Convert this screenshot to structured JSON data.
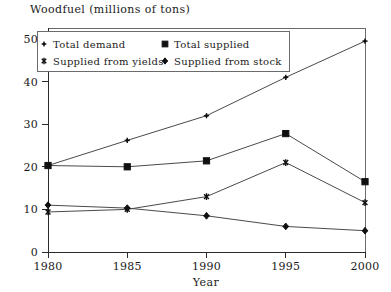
{
  "chart_data": {
    "type": "line",
    "title": "Woodfuel (millions of tons)",
    "xlabel": "Year",
    "ylabel": "",
    "x": [
      1980,
      1985,
      1990,
      1995,
      2000
    ],
    "categories": [
      "1980",
      "1985",
      "1990",
      "1995",
      "2000"
    ],
    "xlim": [
      1980,
      2000
    ],
    "ylim": [
      0,
      53
    ],
    "yticks": [
      0,
      10,
      20,
      30,
      40,
      50
    ],
    "ytick_labels": [
      "0",
      "10",
      "20",
      "30",
      "40",
      "50"
    ],
    "xticks": [
      1980,
      1985,
      1990,
      1995,
      2000
    ],
    "xtick_labels": [
      "1980",
      "1985",
      "1990",
      "1995",
      "2000"
    ],
    "grid": false,
    "legend_position": "top-left-inside",
    "series": [
      {
        "name": "Total demand",
        "marker": "plus",
        "values": [
          20.3,
          26.2,
          32.0,
          41.0,
          49.5
        ]
      },
      {
        "name": "Total supplied",
        "marker": "square",
        "values": [
          20.3,
          20.0,
          21.4,
          27.8,
          16.5
        ]
      },
      {
        "name": "Supplied from yields",
        "marker": "asterisk",
        "values": [
          9.4,
          10.0,
          13.0,
          21.0,
          11.6
        ]
      },
      {
        "name": "Supplied from stock",
        "marker": "diamond",
        "values": [
          11.0,
          10.3,
          8.5,
          6.0,
          5.0
        ]
      }
    ]
  },
  "legend": {
    "entries": [
      {
        "label": "Total demand",
        "marker": "plus-icon"
      },
      {
        "label": "Total supplied",
        "marker": "square-icon"
      },
      {
        "label": "Supplied from yields",
        "marker": "asterisk-icon"
      },
      {
        "label": "Supplied from stock",
        "marker": "diamond-icon"
      }
    ]
  }
}
